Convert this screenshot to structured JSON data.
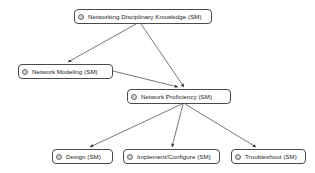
{
  "diagram": {
    "background_color": "#ffffff",
    "node_border_color": "#4a4a4a",
    "edge_color": "#555555",
    "icon_name": "node-bullet-icon",
    "nodes": [
      {
        "id": "networking-disciplinary-knowledge",
        "label": "Networking Disciplinary Knowledge (SM)",
        "x": 74,
        "y": 9,
        "width": 138
      },
      {
        "id": "network-modeling",
        "label": "Network Modeling (SM)",
        "x": 18,
        "y": 64,
        "width": 95
      },
      {
        "id": "network-proficiency",
        "label": "Network Proficiency (SM)",
        "x": 127,
        "y": 89,
        "width": 104
      },
      {
        "id": "design",
        "label": "Design (SM)",
        "x": 52,
        "y": 149,
        "width": 61
      },
      {
        "id": "implement-configure",
        "label": "Implement/Configure (SM)",
        "x": 123,
        "y": 149,
        "width": 97
      },
      {
        "id": "troubleshoot",
        "label": "Troubleshoot (SM)",
        "x": 231,
        "y": 149,
        "width": 75
      }
    ],
    "edges": [
      {
        "from": "networking-disciplinary-knowledge",
        "to": "network-modeling",
        "x1": 136,
        "y1": 24,
        "x2": 68,
        "y2": 62
      },
      {
        "from": "networking-disciplinary-knowledge",
        "to": "network-proficiency",
        "x1": 141,
        "y1": 24,
        "x2": 184,
        "y2": 87
      },
      {
        "from": "network-modeling",
        "to": "network-proficiency",
        "x1": 113,
        "y1": 71,
        "x2": 178,
        "y2": 87
      },
      {
        "from": "network-proficiency",
        "to": "design",
        "x1": 182,
        "y1": 104,
        "x2": 90,
        "y2": 147
      },
      {
        "from": "network-proficiency",
        "to": "implement-configure",
        "x1": 183,
        "y1": 104,
        "x2": 172,
        "y2": 147
      },
      {
        "from": "network-proficiency",
        "to": "troubleshoot",
        "x1": 185,
        "y1": 104,
        "x2": 256,
        "y2": 147
      }
    ]
  }
}
